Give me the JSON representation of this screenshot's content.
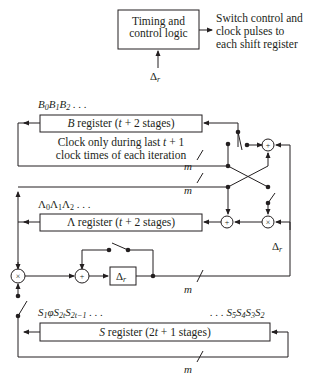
{
  "timing_block": {
    "line1": "Timing and",
    "line2": "control logic",
    "input_label": "Δr",
    "output_line1": "Switch control and",
    "output_line2": "clock pulses to",
    "output_line3": "each shift register"
  },
  "b_register": {
    "label": "B register (t + 2 stages)",
    "sequence": "B0 B1 B2 . . .",
    "note_line1": "Clock only during last t + 1",
    "note_line2": "clock times of each iteration"
  },
  "lambda_register": {
    "label": "Λ register (t + 2 stages)",
    "sequence": "Λ0Λ1Λ2 . . ."
  },
  "s_register": {
    "label": "S register (2t + 1 stages)",
    "sequence_left": "S1φS2t S2t−1 . . .",
    "sequence_right": ". . . S5S4S3S2"
  },
  "delay_block": {
    "label": "Δr"
  },
  "side_label": "Δr",
  "bus_width_label": "m",
  "operators": {
    "adder": "+",
    "multiplier": "×"
  },
  "colors": {
    "line": "#231f20",
    "background": "#ffffff"
  }
}
